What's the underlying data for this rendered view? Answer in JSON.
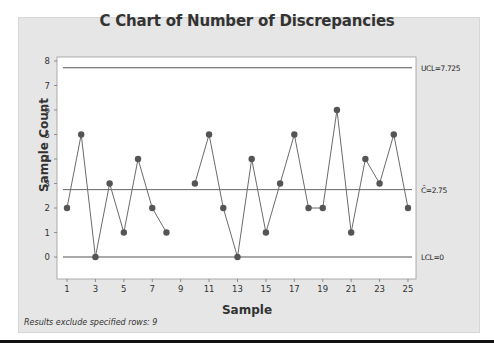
{
  "chart_data": {
    "type": "line",
    "title": "C Chart of Number of Discrepancies",
    "xlabel": "Sample",
    "ylabel": "Sample Count",
    "x": [
      1,
      2,
      3,
      4,
      5,
      6,
      7,
      8,
      9,
      10,
      11,
      12,
      13,
      14,
      15,
      16,
      17,
      18,
      19,
      20,
      21,
      22,
      23,
      24,
      25
    ],
    "values": [
      2,
      5,
      0,
      3,
      1,
      4,
      2,
      1,
      null,
      3,
      5,
      2,
      0,
      4,
      1,
      3,
      5,
      2,
      2,
      6,
      1,
      4,
      3,
      5,
      2
    ],
    "excluded_samples": [
      9
    ],
    "xticks": [
      1,
      3,
      5,
      7,
      9,
      11,
      13,
      15,
      17,
      19,
      21,
      23,
      25
    ],
    "yticks": [
      0,
      1,
      2,
      3,
      4,
      5,
      6,
      7,
      8
    ],
    "ylim": [
      -0.3,
      8.2
    ],
    "xlim": [
      0.5,
      25.5
    ],
    "grid": false,
    "control_limits": {
      "UCL": {
        "value": 7.725,
        "label": "UCL=7.725"
      },
      "center": {
        "value": 2.75,
        "label": "C̄=2.75"
      },
      "LCL": {
        "value": 0,
        "label": "LCL=0"
      }
    },
    "footnote": "Results exclude specified rows: 9",
    "colors": {
      "frame_bg": "#e6e6e6",
      "plot_bg": "#ffffff",
      "line": "#6b6b6b",
      "marker": "#555555",
      "limit_line": "#555555"
    }
  }
}
